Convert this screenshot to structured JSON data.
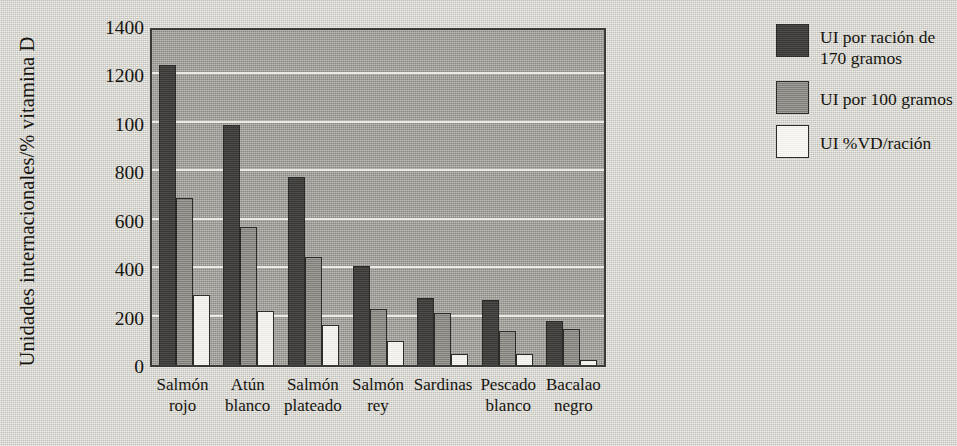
{
  "chart_data": {
    "type": "bar",
    "title": "",
    "xlabel": "",
    "ylabel": "Unidades internacionales/% vitamina D",
    "ylim": [
      0,
      1400
    ],
    "yticks": [
      1400,
      1200,
      100,
      800,
      600,
      400,
      200,
      0
    ],
    "ytick_values": [
      1400,
      1200,
      1000,
      800,
      600,
      400,
      200,
      0
    ],
    "grid": true,
    "legend_position": "right",
    "categories": [
      "Salmón rojo",
      "Atún blanco",
      "Salmón plateado",
      "Salmón rey",
      "Sardinas",
      "Pescado blanco",
      "Bacalao negro"
    ],
    "category_lines": [
      [
        "Salmón",
        "rojo"
      ],
      [
        "Atún",
        "blanco"
      ],
      [
        "Salmón",
        "plateado"
      ],
      [
        "Salmón",
        "rey"
      ],
      [
        "Sardinas",
        ""
      ],
      [
        "Pescado",
        "blanco"
      ],
      [
        "Bacalao",
        "negro"
      ]
    ],
    "series": [
      {
        "name": "UI por ración de 170 gramos",
        "color": "#403f3c",
        "values": [
          1240,
          990,
          775,
          410,
          275,
          270,
          180
        ]
      },
      {
        "name": "UI por 100 gramos",
        "color": "#8d8b85",
        "values": [
          690,
          570,
          445,
          230,
          215,
          140,
          150
        ]
      },
      {
        "name": "UI %VD/ración",
        "color": "#f2f1ec",
        "values": [
          290,
          225,
          165,
          100,
          45,
          45,
          20
        ]
      }
    ]
  },
  "legend": {
    "entries": [
      {
        "line1": "UI por ración de",
        "line2": "170 gramos"
      },
      {
        "line1": "UI por 100 gramos",
        "line2": ""
      },
      {
        "line1": "UI %VD/ración",
        "line2": ""
      }
    ]
  }
}
